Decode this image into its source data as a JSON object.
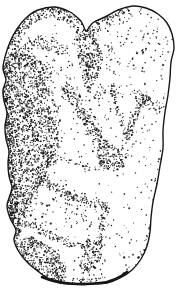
{
  "image": {
    "alt": "Pen-and-ink stipple drawing of a lumpy carved stone figurine depicting a human figure crouched in fetal position, two rounded lobes at top forming the head, heavy dot shading along the left flank and between the folded limbs",
    "ink": "#161616",
    "paper": "#ffffff",
    "width": 176,
    "height": 292
  },
  "figure": {
    "seed": 1337,
    "dot_density_factor": 0.085,
    "outline_stroke_width": 1.4,
    "bottom_edge_path": "M42,277 C60,285 85,285 100,283 C112,282 121,277 127,272",
    "bottom_edge_width": 2.6,
    "outline_points": [
      [
        55,
        7
      ],
      [
        70,
        12
      ],
      [
        80,
        20
      ],
      [
        83,
        25
      ],
      [
        86,
        31
      ],
      [
        90,
        26
      ],
      [
        94,
        22
      ],
      [
        105,
        17
      ],
      [
        118,
        10
      ],
      [
        133,
        6
      ],
      [
        146,
        8
      ],
      [
        158,
        14
      ],
      [
        167,
        23
      ],
      [
        172,
        34
      ],
      [
        174,
        48
      ],
      [
        171,
        62
      ],
      [
        170,
        78
      ],
      [
        168,
        95
      ],
      [
        165,
        112
      ],
      [
        163,
        131
      ],
      [
        163,
        148
      ],
      [
        160,
        166
      ],
      [
        157,
        184
      ],
      [
        153,
        202
      ],
      [
        151,
        218
      ],
      [
        150,
        232
      ],
      [
        147,
        246
      ],
      [
        141,
        259
      ],
      [
        132,
        270
      ],
      [
        120,
        278
      ],
      [
        107,
        283
      ],
      [
        92,
        284
      ],
      [
        75,
        284
      ],
      [
        60,
        283
      ],
      [
        49,
        279
      ],
      [
        39,
        272
      ],
      [
        28,
        263
      ],
      [
        19,
        252
      ],
      [
        14,
        240
      ],
      [
        16,
        230
      ],
      [
        10,
        218
      ],
      [
        7,
        206
      ],
      [
        10,
        195
      ],
      [
        12,
        187
      ],
      [
        9,
        176
      ],
      [
        8,
        163
      ],
      [
        9,
        151
      ],
      [
        6,
        139
      ],
      [
        5,
        126
      ],
      [
        7,
        113
      ],
      [
        4,
        101
      ],
      [
        3,
        90
      ],
      [
        6,
        80
      ],
      [
        3,
        69
      ],
      [
        5,
        57
      ],
      [
        10,
        42
      ],
      [
        17,
        29
      ],
      [
        26,
        18
      ],
      [
        38,
        10
      ]
    ],
    "regions": [
      {
        "t": "b",
        "pts": [
          [
            11,
            50
          ],
          [
            15,
            36
          ],
          [
            24,
            23
          ],
          [
            37,
            13
          ],
          [
            55,
            11
          ],
          [
            70,
            17
          ],
          [
            80,
            26
          ]
        ],
        "w": 14,
        "d": 2.9
      },
      {
        "t": "p",
        "pts": [
          [
            12,
            56
          ],
          [
            26,
            38
          ],
          [
            44,
            34
          ],
          [
            60,
            40
          ],
          [
            74,
            52
          ],
          [
            62,
            54
          ],
          [
            46,
            50
          ],
          [
            30,
            54
          ],
          [
            16,
            62
          ]
        ],
        "d": 2.0
      },
      {
        "t": "p",
        "pts": [
          [
            4,
            62
          ],
          [
            9,
            50
          ],
          [
            22,
            52
          ],
          [
            34,
            56
          ],
          [
            42,
            62
          ],
          [
            46,
            80
          ],
          [
            48,
            102
          ],
          [
            55,
            122
          ],
          [
            58,
            142
          ],
          [
            52,
            162
          ],
          [
            44,
            178
          ],
          [
            34,
            194
          ],
          [
            26,
            212
          ],
          [
            22,
            230
          ],
          [
            16,
            242
          ],
          [
            11,
            236
          ],
          [
            14,
            228
          ],
          [
            9,
            214
          ],
          [
            8,
            200
          ],
          [
            11,
            190
          ],
          [
            9,
            176
          ],
          [
            8,
            162
          ],
          [
            9,
            150
          ],
          [
            6,
            138
          ],
          [
            5,
            125
          ],
          [
            7,
            112
          ],
          [
            4,
            100
          ],
          [
            3,
            88
          ],
          [
            6,
            79
          ],
          [
            3,
            68
          ]
        ],
        "d": 3.2
      },
      {
        "t": "b",
        "pts": [
          [
            5,
            64
          ],
          [
            5,
            88
          ],
          [
            6,
            112
          ],
          [
            8,
            136
          ],
          [
            10,
            158
          ],
          [
            10,
            178
          ],
          [
            11,
            198
          ],
          [
            13,
            218
          ],
          [
            16,
            236
          ]
        ],
        "w": 11,
        "d": 2.4
      },
      {
        "t": "b",
        "pts": [
          [
            46,
            64
          ],
          [
            50,
            86
          ],
          [
            54,
            108
          ],
          [
            60,
            132
          ],
          [
            57,
            152
          ],
          [
            47,
            170
          ],
          [
            37,
            188
          ],
          [
            29,
            206
          ],
          [
            25,
            224
          ]
        ],
        "w": 9,
        "d": 1.1
      },
      {
        "t": "p",
        "pts": [
          [
            78,
            26
          ],
          [
            87,
            29
          ],
          [
            95,
            35
          ],
          [
            100,
            45
          ],
          [
            103,
            58
          ],
          [
            100,
            72
          ],
          [
            94,
            84
          ],
          [
            88,
            92
          ],
          [
            83,
            80
          ],
          [
            79,
            64
          ],
          [
            77,
            46
          ],
          [
            75,
            34
          ]
        ],
        "d": 3.1
      },
      {
        "t": "e",
        "c": [
          97,
          92
        ],
        "rx": 9,
        "ry": 9,
        "d": 0.9
      },
      {
        "t": "e",
        "c": [
          109,
          58
        ],
        "rx": 7,
        "ry": 13,
        "d": 0.45
      },
      {
        "t": "b",
        "pts": [
          [
            89,
            33
          ],
          [
            97,
            26
          ],
          [
            107,
            19
          ],
          [
            118,
            13
          ],
          [
            129,
            10
          ]
        ],
        "w": 7,
        "d": 2.6
      },
      {
        "t": "b",
        "pts": [
          [
            91,
            36
          ],
          [
            100,
            29
          ],
          [
            110,
            23
          ],
          [
            121,
            17
          ],
          [
            131,
            13
          ]
        ],
        "w": 13,
        "d": 0.7
      },
      {
        "t": "b",
        "pts": [
          [
            64,
            84
          ],
          [
            74,
            100
          ],
          [
            85,
            118
          ],
          [
            97,
            136
          ],
          [
            107,
            150
          ]
        ],
        "w": 9,
        "d": 2.9
      },
      {
        "t": "b",
        "pts": [
          [
            64,
            84
          ],
          [
            74,
            100
          ],
          [
            85,
            118
          ],
          [
            97,
            136
          ],
          [
            107,
            150
          ]
        ],
        "w": 17,
        "d": 0.65
      },
      {
        "t": "p",
        "pts": [
          [
            98,
            146
          ],
          [
            112,
            145
          ],
          [
            124,
            150
          ],
          [
            128,
            158
          ],
          [
            122,
            168
          ],
          [
            112,
            172
          ],
          [
            102,
            168
          ],
          [
            96,
            157
          ]
        ],
        "d": 3.0
      },
      {
        "t": "b",
        "pts": [
          [
            124,
            153
          ],
          [
            133,
            157
          ]
        ],
        "w": 3,
        "d": 1.4
      },
      {
        "t": "b",
        "pts": [
          [
            111,
            87
          ],
          [
            117,
            105
          ],
          [
            122,
            122
          ],
          [
            126,
            138
          ]
        ],
        "w": 5,
        "d": 2.2
      },
      {
        "t": "e",
        "c": [
          112,
          90
        ],
        "rx": 5,
        "ry": 7,
        "d": 1.8
      },
      {
        "t": "b",
        "pts": [
          [
            144,
            99
          ],
          [
            137,
            112
          ],
          [
            131,
            126
          ],
          [
            127,
            140
          ]
        ],
        "w": 7,
        "d": 3.0
      },
      {
        "t": "p",
        "pts": [
          [
            135,
            92
          ],
          [
            149,
            94
          ],
          [
            152,
            103
          ],
          [
            146,
            112
          ],
          [
            137,
            107
          ]
        ],
        "d": 2.5
      },
      {
        "t": "e",
        "c": [
          126,
          147
        ],
        "rx": 4,
        "ry": 6,
        "d": 1.0
      },
      {
        "t": "e",
        "c": [
          157,
          106
        ],
        "rx": 6,
        "ry": 8,
        "d": 1.0
      },
      {
        "t": "b",
        "pts": [
          [
            46,
            152
          ],
          [
            62,
            158
          ],
          [
            78,
            163
          ],
          [
            94,
            167
          ],
          [
            106,
            170
          ]
        ],
        "w": 4,
        "d": 1.5
      },
      {
        "t": "b",
        "pts": [
          [
            40,
            180
          ],
          [
            55,
            188
          ],
          [
            72,
            196
          ],
          [
            90,
            202
          ],
          [
            108,
            206
          ]
        ],
        "w": 7,
        "d": 2.8
      },
      {
        "t": "b",
        "pts": [
          [
            40,
            180
          ],
          [
            55,
            188
          ],
          [
            72,
            196
          ],
          [
            90,
            202
          ],
          [
            108,
            206
          ]
        ],
        "w": 13,
        "d": 0.7
      },
      {
        "t": "b",
        "pts": [
          [
            108,
            206
          ],
          [
            104,
            220
          ],
          [
            101,
            234
          ],
          [
            98,
            246
          ]
        ],
        "w": 6,
        "d": 2.4
      },
      {
        "t": "b",
        "pts": [
          [
            26,
            222
          ],
          [
            40,
            230
          ],
          [
            56,
            238
          ],
          [
            72,
            244
          ],
          [
            88,
            248
          ]
        ],
        "w": 7,
        "d": 2.6
      },
      {
        "t": "p",
        "pts": [
          [
            18,
            240
          ],
          [
            32,
            236
          ],
          [
            48,
            245
          ],
          [
            60,
            255
          ],
          [
            66,
            267
          ],
          [
            66,
            279
          ],
          [
            55,
            283
          ],
          [
            42,
            279
          ],
          [
            29,
            270
          ],
          [
            19,
            257
          ],
          [
            14,
            248
          ]
        ],
        "d": 3.3
      },
      {
        "t": "p",
        "pts": [
          [
            88,
            238
          ],
          [
            100,
            240
          ],
          [
            104,
            250
          ],
          [
            100,
            260
          ],
          [
            92,
            268
          ],
          [
            83,
            274
          ],
          [
            80,
            266
          ],
          [
            82,
            252
          ]
        ],
        "d": 2.8
      },
      {
        "t": "b",
        "pts": [
          [
            48,
            276
          ],
          [
            66,
            281
          ],
          [
            86,
            282
          ],
          [
            104,
            279
          ]
        ],
        "w": 6,
        "d": 2.0
      },
      {
        "t": "e",
        "c": [
          93,
          266
        ],
        "rx": 11,
        "ry": 10,
        "d": 0.4
      },
      {
        "t": "b",
        "pts": [
          [
            148,
            233
          ],
          [
            143,
            252
          ],
          [
            134,
            266
          ],
          [
            122,
            274
          ]
        ],
        "w": 4,
        "d": 1.3
      },
      {
        "t": "b",
        "pts": [
          [
            101,
            228
          ],
          [
            100,
            246
          ],
          [
            104,
            262
          ]
        ],
        "w": 3,
        "d": 1.1
      },
      {
        "t": "b",
        "pts": [
          [
            162,
            150
          ],
          [
            158,
            172
          ],
          [
            155,
            192
          ],
          [
            152,
            212
          ],
          [
            150,
            230
          ]
        ],
        "w": 3.5,
        "d": 0.8
      },
      {
        "t": "b",
        "pts": [
          [
            17,
            250
          ],
          [
            27,
            263
          ],
          [
            39,
            274
          ],
          [
            51,
            280
          ]
        ],
        "w": 5,
        "d": 2.2
      },
      {
        "t": "p",
        "pts": [
          [
            95,
            32
          ],
          [
            120,
            16
          ],
          [
            145,
            12
          ],
          [
            163,
            24
          ],
          [
            171,
            45
          ],
          [
            168,
            75
          ],
          [
            163,
            105
          ],
          [
            158,
            130
          ],
          [
            150,
            112
          ],
          [
            140,
            96
          ],
          [
            120,
            96
          ],
          [
            106,
            80
          ],
          [
            100,
            60
          ],
          [
            94,
            44
          ]
        ],
        "d": 0.22
      },
      {
        "t": "e",
        "c": [
          123,
          44
        ],
        "rx": 4,
        "ry": 3,
        "d": 1.3
      },
      {
        "t": "e",
        "c": [
          144,
          52
        ],
        "rx": 5,
        "ry": 4,
        "d": 1.0
      },
      {
        "t": "e",
        "c": [
          118,
          63
        ],
        "rx": 2.5,
        "ry": 2.5,
        "d": 1.4
      },
      {
        "t": "e",
        "c": [
          128,
          76
        ],
        "rx": 3,
        "ry": 3,
        "d": 1.0
      },
      {
        "t": "e",
        "c": [
          137,
          91
        ],
        "rx": 5,
        "ry": 4,
        "d": 1.2
      },
      {
        "t": "p",
        "pts": [
          [
            86,
            96
          ],
          [
            108,
            90
          ],
          [
            112,
            110
          ],
          [
            107,
            132
          ],
          [
            98,
            140
          ],
          [
            90,
            120
          ]
        ],
        "d": 0.35
      },
      {
        "t": "e",
        "c": [
          58,
          66
        ],
        "rx": 14,
        "ry": 20,
        "d": 0.3
      },
      {
        "t": "p",
        "pts": [
          [
            28,
            198
          ],
          [
            58,
            196
          ],
          [
            88,
            210
          ],
          [
            99,
            220
          ],
          [
            87,
            231
          ],
          [
            58,
            228
          ],
          [
            36,
            226
          ],
          [
            23,
            214
          ]
        ],
        "d": 0.3
      },
      {
        "t": "p",
        "pts": [
          [
            4,
            6
          ],
          [
            174,
            6
          ],
          [
            174,
            285
          ],
          [
            4,
            285
          ]
        ],
        "d": 0.12
      }
    ]
  }
}
